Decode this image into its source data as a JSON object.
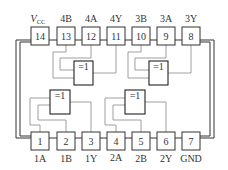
{
  "diagram": {
    "type": "ic-pinout",
    "gate_symbol": "=1",
    "top_pins": [
      {
        "number": "14",
        "label_main": "V",
        "label_sub": "CC"
      },
      {
        "number": "13",
        "label_main": "4B",
        "label_sub": ""
      },
      {
        "number": "12",
        "label_main": "4A",
        "label_sub": ""
      },
      {
        "number": "11",
        "label_main": "4Y",
        "label_sub": ""
      },
      {
        "number": "10",
        "label_main": "3B",
        "label_sub": ""
      },
      {
        "number": "9",
        "label_main": "3A",
        "label_sub": ""
      },
      {
        "number": "8",
        "label_main": "3Y",
        "label_sub": ""
      }
    ],
    "bottom_pins": [
      {
        "number": "1",
        "label": "1A"
      },
      {
        "number": "2",
        "label": "1B"
      },
      {
        "number": "3",
        "label": "1Y"
      },
      {
        "number": "4",
        "label": "2A"
      },
      {
        "number": "5",
        "label": "2B"
      },
      {
        "number": "6",
        "label": "2Y"
      },
      {
        "number": "7",
        "label": "GND"
      }
    ],
    "gates": [
      {
        "id": "gate-1",
        "symbol": "=1",
        "inputs": [
          "1A",
          "1B"
        ],
        "output": "1Y"
      },
      {
        "id": "gate-2",
        "symbol": "=1",
        "inputs": [
          "2A",
          "2B"
        ],
        "output": "2Y"
      },
      {
        "id": "gate-3",
        "symbol": "=1",
        "inputs": [
          "3A",
          "3B"
        ],
        "output": "3Y"
      },
      {
        "id": "gate-4",
        "symbol": "=1",
        "inputs": [
          "4A",
          "4B"
        ],
        "output": "4Y"
      }
    ]
  }
}
